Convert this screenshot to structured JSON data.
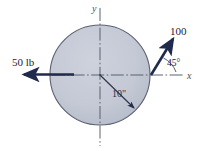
{
  "figure": {
    "colors": {
      "disk_fill": "#c4c9d5",
      "disk_edge": "#5a6170",
      "force_arrow": "#1f2a4d",
      "axis_line": "#5b6270",
      "text": "#1c2338"
    },
    "axes": {
      "x_label": "x",
      "y_label": "y"
    },
    "disk": {
      "center": [
        100,
        75
      ],
      "radius": 50,
      "dimension_label": "10\""
    },
    "forces": [
      {
        "name": "force-left",
        "label": "50 lb",
        "magnitude": 50,
        "unit": "lb",
        "direction_deg": 180
      },
      {
        "name": "force-upper-right",
        "label": "100",
        "magnitude": 100,
        "unit": "",
        "direction_deg": 45
      }
    ],
    "angles": [
      {
        "name": "angle-45",
        "label": "45°",
        "value": 45,
        "unit": "deg"
      }
    ]
  }
}
